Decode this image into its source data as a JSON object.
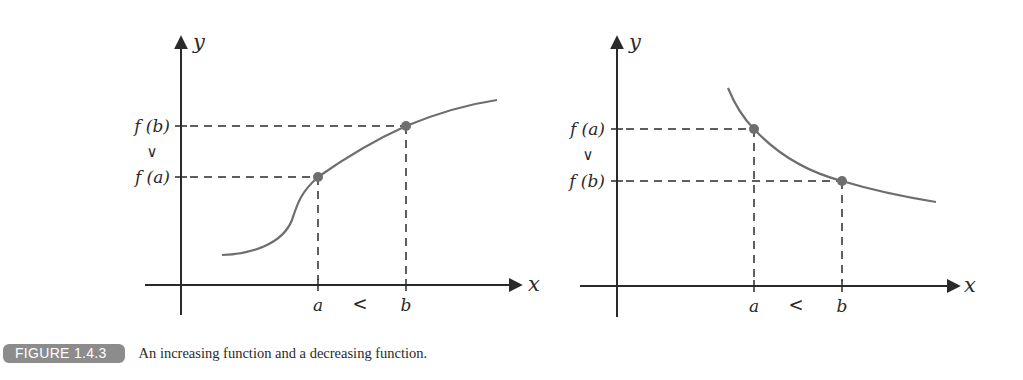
{
  "figure": {
    "label": "FIGURE 1.4.3",
    "caption": "An increasing function and a decreasing function.",
    "colors": {
      "axis": "#2a2a2a",
      "curve": "#6e6e6e",
      "point": "#6e6e6e",
      "dashes": "#2a2a2a",
      "badge_bg": "#8c8c8c",
      "badge_text": "#ffffff"
    }
  },
  "panels": [
    {
      "name": "increasing",
      "x_axis_label": "x",
      "y_axis_label": "y",
      "x_ticks": [
        "a",
        "b"
      ],
      "x_relation": "<",
      "y_ticks_top_to_bottom": [
        "f (b)",
        "f (a)"
      ],
      "y_relation": "∨",
      "points": [
        {
          "label": "(a, f(a))",
          "x": "a",
          "y": "f(a)"
        },
        {
          "label": "(b, f(b))",
          "x": "b",
          "y": "f(b)"
        }
      ]
    },
    {
      "name": "decreasing",
      "x_axis_label": "x",
      "y_axis_label": "y",
      "x_ticks": [
        "a",
        "b"
      ],
      "x_relation": "<",
      "y_ticks_top_to_bottom": [
        "f (a)",
        "f (b)"
      ],
      "y_relation": "∨",
      "points": [
        {
          "label": "(a, f(a))",
          "x": "a",
          "y": "f(a)"
        },
        {
          "label": "(b, f(b))",
          "x": "b",
          "y": "f(b)"
        }
      ]
    }
  ]
}
